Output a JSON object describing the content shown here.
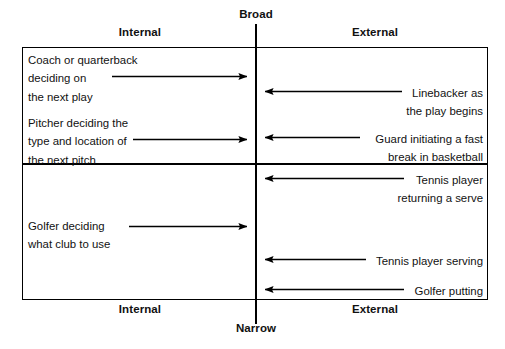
{
  "diagram": {
    "title_top": "Broad",
    "title_bottom": "Narrow",
    "column_header_left": "Internal",
    "column_header_right": "External",
    "column_footer_left": "Internal",
    "column_footer_right": "External",
    "quadrants": {
      "top_left": {
        "items": [
          {
            "text": "Coach or quarterback\ndeciding on\nthe next play"
          },
          {
            "text": "Pitcher deciding the\ntype and location of\nthe next pitch"
          }
        ]
      },
      "top_right": {
        "items": [
          {
            "text": "Linebacker as\nthe play begins"
          },
          {
            "text": "Guard initiating a fast\nbreak in basketball"
          }
        ]
      },
      "bottom_left": {
        "items": [
          {
            "text": "Golfer deciding\nwhat club to use"
          }
        ]
      },
      "bottom_right": {
        "items": [
          {
            "text": "Tennis player\nreturning a serve"
          },
          {
            "text": "Tennis player serving"
          },
          {
            "text": "Golfer putting"
          }
        ]
      }
    },
    "arrows": [
      {
        "name": "arrow-coach-quarterback",
        "direction": "right"
      },
      {
        "name": "arrow-pitcher",
        "direction": "right"
      },
      {
        "name": "arrow-golfer-club",
        "direction": "right"
      },
      {
        "name": "arrow-linebacker",
        "direction": "left"
      },
      {
        "name": "arrow-guard-fast-break",
        "direction": "left"
      },
      {
        "name": "arrow-tennis-returning",
        "direction": "left"
      },
      {
        "name": "arrow-tennis-serving",
        "direction": "left"
      },
      {
        "name": "arrow-golfer-putting",
        "direction": "left"
      }
    ],
    "colors": {
      "line": "#000000",
      "text": "#111111",
      "background": "#ffffff"
    }
  }
}
